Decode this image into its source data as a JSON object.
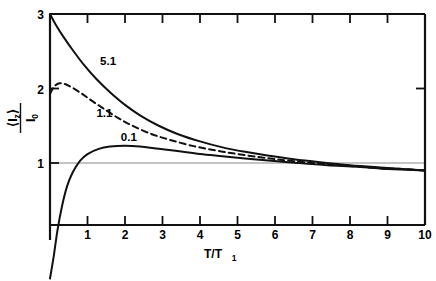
{
  "figure": {
    "background": "#ffffff",
    "ink": "#000000",
    "reference_line_color": "#8a8a8a"
  },
  "axes": {
    "x": {
      "label_text": "T/T",
      "label_sub": "1",
      "ticks": [
        "1",
        "2",
        "3",
        "4",
        "5",
        "6",
        "7",
        "8",
        "9",
        "10"
      ],
      "min": 0,
      "max": 10
    },
    "y": {
      "label_numerator": "⟨I",
      "label_numerator_sub": "z",
      "label_numerator_close": "⟩",
      "label_denominator": "I",
      "label_denominator_sub": "0",
      "ticks": [
        "1",
        "2",
        "3"
      ],
      "min": -0.6,
      "max": 3.0
    }
  },
  "curve_labels": [
    {
      "name": "curve-label-5-1",
      "text": "5.1"
    },
    {
      "name": "curve-label-1-1",
      "text": "1.1"
    },
    {
      "name": "curve-label-0-1",
      "text": "0.1"
    }
  ],
  "chart_data": {
    "type": "line",
    "title": "",
    "xlabel": "T/T1",
    "ylabel": "<Iz>/I0",
    "xlim": [
      0,
      10
    ],
    "ylim": [
      -0.6,
      3.0
    ],
    "grid": false,
    "legend": "inline-curve-labels",
    "xticks": [
      1,
      2,
      3,
      4,
      5,
      6,
      7,
      8,
      9,
      10
    ],
    "yticks": [
      1,
      2,
      3
    ],
    "reference_lines": [
      {
        "axis": "y",
        "value": 1,
        "style": "thin-solid-gray"
      }
    ],
    "series": [
      {
        "name": "5.1",
        "style": "solid",
        "label_position": {
          "x": 1.55,
          "y": 2.32
        },
        "x": [
          0.0,
          0.15,
          0.35,
          0.6,
          0.9,
          1.25,
          1.6,
          2.0,
          2.4,
          2.9,
          3.4,
          4.0,
          4.6,
          5.2,
          5.8,
          6.5,
          7.2,
          8.0,
          8.8,
          9.4,
          10.0
        ],
        "y": [
          3.0,
          2.86,
          2.7,
          2.52,
          2.32,
          2.12,
          1.95,
          1.78,
          1.64,
          1.5,
          1.39,
          1.29,
          1.21,
          1.15,
          1.1,
          1.05,
          1.01,
          0.97,
          0.94,
          0.92,
          0.9
        ]
      },
      {
        "name": "1.1",
        "style": "dashed",
        "label_position": {
          "x": 1.45,
          "y": 1.62
        },
        "x": [
          0.0,
          0.12,
          0.25,
          0.4,
          0.6,
          0.85,
          1.1,
          1.4,
          1.8,
          2.2,
          2.7,
          3.2,
          3.8,
          4.4,
          5.0,
          5.7,
          6.4,
          7.2,
          8.0,
          8.8,
          9.4,
          10.0
        ],
        "y": [
          1.93,
          2.03,
          2.07,
          2.06,
          2.01,
          1.93,
          1.84,
          1.74,
          1.61,
          1.5,
          1.39,
          1.31,
          1.23,
          1.17,
          1.12,
          1.07,
          1.03,
          0.99,
          0.96,
          0.93,
          0.92,
          0.9
        ]
      },
      {
        "name": "0.1",
        "style": "solid",
        "label_position": {
          "x": 2.1,
          "y": 1.3
        },
        "x": [
          0.0,
          0.1,
          0.2,
          0.32,
          0.45,
          0.6,
          0.8,
          1.0,
          1.3,
          1.6,
          2.0,
          2.4,
          2.9,
          3.4,
          4.0,
          4.6,
          5.2,
          5.9,
          6.6,
          7.4,
          8.2,
          9.0,
          9.5,
          10.0
        ],
        "y": [
          -0.55,
          -0.25,
          0.1,
          0.42,
          0.68,
          0.87,
          1.03,
          1.12,
          1.19,
          1.22,
          1.23,
          1.22,
          1.19,
          1.16,
          1.12,
          1.09,
          1.06,
          1.03,
          1.0,
          0.97,
          0.95,
          0.92,
          0.91,
          0.9
        ]
      }
    ]
  }
}
